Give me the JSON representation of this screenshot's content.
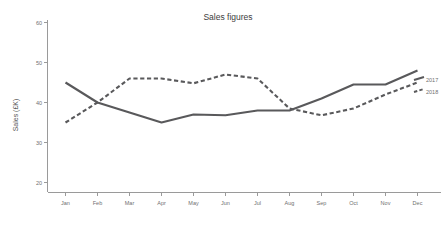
{
  "chart_data": {
    "type": "line",
    "title": "Sales figures",
    "xlabel": "",
    "ylabel": "Sales (£K)",
    "categories": [
      "Jan",
      "Feb",
      "Mar",
      "Apr",
      "May",
      "Jun",
      "Jul",
      "Aug",
      "Sep",
      "Oct",
      "Nov",
      "Dec"
    ],
    "series": [
      {
        "name": "2017",
        "style": "solid",
        "color": "#59595b",
        "values": [
          45,
          40,
          37.5,
          35,
          37,
          36.8,
          38,
          38,
          41,
          44.5,
          44.5,
          48
        ]
      },
      {
        "name": "2018",
        "style": "dashed",
        "color": "#59595b",
        "values": [
          35,
          40,
          46,
          46,
          44.8,
          47,
          46,
          38.5,
          36.8,
          38.5,
          42,
          45
        ]
      }
    ],
    "ylim": [
      20,
      60
    ],
    "yticks": [
      20,
      30,
      40,
      50,
      60
    ],
    "ytick_labels": [
      "20",
      "30",
      "40",
      "50",
      "60"
    ],
    "grid": false,
    "legend_position": "right-inline"
  },
  "axis": {
    "y_title": "Sales (£K)",
    "y_ticks": [
      "60",
      "50",
      "40",
      "30",
      "20"
    ],
    "x_ticks": [
      "Jan",
      "Feb",
      "Mar",
      "Apr",
      "May",
      "Jun",
      "Jul",
      "Aug",
      "Sep",
      "Oct",
      "Nov",
      "Dec"
    ]
  },
  "legend": {
    "entries": [
      {
        "label": "2017"
      },
      {
        "label": "2018"
      }
    ]
  }
}
